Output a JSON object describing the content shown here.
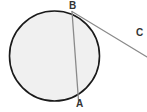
{
  "figure": {
    "kind": "geometry-diagram",
    "width": 147,
    "height": 112,
    "background_color": "#ffffff"
  },
  "circle": {
    "name": "circle",
    "center_x": 54.5,
    "center_y": 56,
    "radius": 45,
    "fill_color": "#f0f0f0",
    "stroke_color": "#1a1a1a",
    "stroke_width": 1.6
  },
  "points": [
    {
      "id": "B",
      "label": "B",
      "x": 72,
      "y": 11.5,
      "label_x": 69,
      "label_y": 1,
      "on_circle": true
    },
    {
      "id": "A",
      "label": "A",
      "x": 78.5,
      "y": 100.5,
      "label_x": 76,
      "label_y": 99,
      "on_circle": true
    },
    {
      "id": "C",
      "label": "C",
      "x": 133,
      "y": 38,
      "label_x": 136,
      "label_y": 28,
      "on_circle": false
    }
  ],
  "segments": [
    {
      "id": "chord-BA",
      "name": "chord-b-to-a",
      "from": "B",
      "to": "A",
      "x1": 72,
      "y1": 11.5,
      "x2": 78.5,
      "y2": 100.5,
      "stroke_color": "#8a8a8a",
      "stroke_width": 1.3
    },
    {
      "id": "ray-BC",
      "name": "ray-b-through-c",
      "from": "B",
      "to": "edge",
      "x1": 72,
      "y1": 11.5,
      "x2": 147,
      "y2": 57,
      "stroke_color": "#8a8a8a",
      "stroke_width": 1.1
    }
  ],
  "text_color": "#333333"
}
